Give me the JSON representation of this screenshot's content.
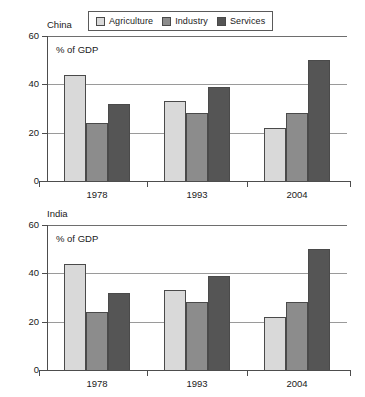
{
  "legend": {
    "entries": [
      {
        "label": "Agriculture",
        "color": "#d9d9d9"
      },
      {
        "label": "Industry",
        "color": "#8c8c8c"
      },
      {
        "label": "Services",
        "color": "#555555"
      }
    ]
  },
  "axis_note": "% of GDP",
  "yticks": [
    "0",
    "20",
    "40",
    "60"
  ],
  "panels": [
    {
      "title": "China",
      "note": "% of GDP"
    },
    {
      "title": "India",
      "note": "% of GDP"
    }
  ],
  "chart_data": [
    {
      "type": "bar",
      "title": "China",
      "xlabel": "",
      "ylabel": "% of GDP",
      "ylim": [
        0,
        60
      ],
      "yticks": [
        0,
        20,
        40,
        60
      ],
      "grid": true,
      "legend_position": "top",
      "categories": [
        "1978",
        "1993",
        "2004"
      ],
      "series": [
        {
          "name": "Agriculture",
          "color": "#d9d9d9",
          "values": [
            44,
            33,
            22
          ]
        },
        {
          "name": "Industry",
          "color": "#8c8c8c",
          "values": [
            24,
            28,
            28
          ]
        },
        {
          "name": "Services",
          "color": "#555555",
          "values": [
            32,
            39,
            50
          ]
        }
      ]
    },
    {
      "type": "bar",
      "title": "India",
      "xlabel": "",
      "ylabel": "% of GDP",
      "ylim": [
        0,
        60
      ],
      "yticks": [
        0,
        20,
        40,
        60
      ],
      "grid": true,
      "legend_position": "top",
      "categories": [
        "1978",
        "1993",
        "2004"
      ],
      "series": [
        {
          "name": "Agriculture",
          "color": "#d9d9d9",
          "values": [
            44,
            33,
            22
          ]
        },
        {
          "name": "Industry",
          "color": "#8c8c8c",
          "values": [
            24,
            28,
            28
          ]
        },
        {
          "name": "Services",
          "color": "#555555",
          "values": [
            32,
            39,
            50
          ]
        }
      ]
    }
  ]
}
